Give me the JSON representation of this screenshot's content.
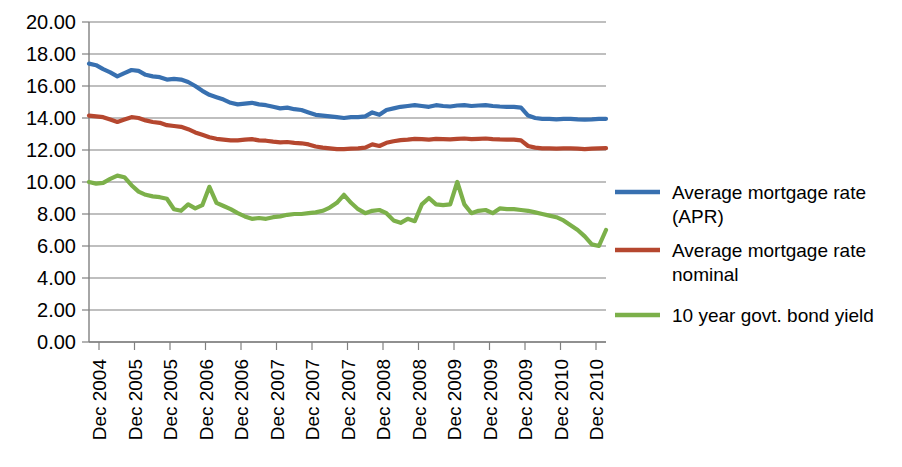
{
  "chart_data": {
    "type": "line",
    "title": "",
    "subtitle": "",
    "xlabel": "",
    "ylabel": "",
    "ylim": [
      0.0,
      20.0
    ],
    "y_ticks": [
      "0.00",
      "2.00",
      "4.00",
      "6.00",
      "8.00",
      "10.00",
      "12.00",
      "14.00",
      "16.00",
      "18.00",
      "20.00"
    ],
    "y_tick_values": [
      0,
      2,
      4,
      6,
      8,
      10,
      12,
      14,
      16,
      18,
      20
    ],
    "grid": true,
    "legend_position": "right",
    "x_tick_labels": [
      "Dec 2004",
      "Dec 2005",
      "Dec 2005",
      "Dec 2006",
      "Dec 2006",
      "Dec 2007",
      "Dec 2007",
      "Dec 2007",
      "Dec 2008",
      "Dec 2008",
      "Dec 2009",
      "Dec 2009",
      "Dec 2009",
      "Dec 2010",
      "Dec 2010"
    ],
    "x_index_count": 74,
    "series": [
      {
        "name": "Average mortgage rate (APR)",
        "color": "#3870b0",
        "values": [
          17.4,
          17.3,
          17.05,
          16.85,
          16.6,
          16.8,
          17.0,
          16.95,
          16.7,
          16.6,
          16.55,
          16.4,
          16.45,
          16.4,
          16.25,
          16.0,
          15.7,
          15.45,
          15.3,
          15.15,
          14.95,
          14.85,
          14.9,
          14.95,
          14.85,
          14.8,
          14.7,
          14.6,
          14.65,
          14.55,
          14.5,
          14.35,
          14.2,
          14.15,
          14.1,
          14.05,
          14.0,
          14.05,
          14.05,
          14.1,
          14.35,
          14.2,
          14.5,
          14.6,
          14.7,
          14.75,
          14.8,
          14.75,
          14.7,
          14.8,
          14.75,
          14.72,
          14.78,
          14.8,
          14.75,
          14.78,
          14.8,
          14.75,
          14.72,
          14.7,
          14.7,
          14.65,
          14.15,
          14.0,
          13.95,
          13.95,
          13.92,
          13.95,
          13.95,
          13.92,
          13.9,
          13.92,
          13.95,
          13.95
        ]
      },
      {
        "name": "Average mortgage rate nominal",
        "color": "#b5472f",
        "values": [
          14.15,
          14.1,
          14.05,
          13.9,
          13.75,
          13.9,
          14.05,
          14.0,
          13.85,
          13.75,
          13.7,
          13.55,
          13.5,
          13.45,
          13.3,
          13.1,
          12.95,
          12.8,
          12.7,
          12.65,
          12.6,
          12.6,
          12.65,
          12.68,
          12.6,
          12.58,
          12.52,
          12.48,
          12.5,
          12.45,
          12.42,
          12.35,
          12.22,
          12.15,
          12.1,
          12.05,
          12.05,
          12.08,
          12.1,
          12.15,
          12.35,
          12.25,
          12.45,
          12.55,
          12.62,
          12.65,
          12.7,
          12.68,
          12.65,
          12.7,
          12.68,
          12.66,
          12.7,
          12.72,
          12.68,
          12.7,
          12.72,
          12.68,
          12.66,
          12.65,
          12.65,
          12.6,
          12.25,
          12.15,
          12.1,
          12.1,
          12.08,
          12.1,
          12.1,
          12.08,
          12.05,
          12.08,
          12.1,
          12.12
        ]
      },
      {
        "name": "10 year govt. bond yield",
        "color": "#7cb04a",
        "values": [
          10.0,
          9.9,
          9.95,
          10.2,
          10.4,
          10.3,
          9.8,
          9.4,
          9.2,
          9.1,
          9.05,
          8.95,
          8.3,
          8.2,
          8.6,
          8.35,
          8.55,
          9.7,
          8.7,
          8.5,
          8.3,
          8.05,
          7.85,
          7.7,
          7.75,
          7.7,
          7.8,
          7.85,
          7.95,
          8.0,
          8.0,
          8.05,
          8.1,
          8.2,
          8.4,
          8.7,
          9.2,
          8.7,
          8.3,
          8.05,
          8.2,
          8.25,
          8.05,
          7.6,
          7.45,
          7.7,
          7.55,
          8.6,
          9.0,
          8.6,
          8.55,
          8.6,
          10.0,
          8.6,
          8.05,
          8.2,
          8.25,
          8.05,
          8.35,
          8.3,
          8.3,
          8.25,
          8.2,
          8.1,
          8.0,
          7.9,
          7.8,
          7.6,
          7.3,
          7.0,
          6.6,
          6.1,
          6.0,
          7.0
        ]
      }
    ]
  },
  "legend": {
    "items": [
      {
        "label_line1": "Average mortgage rate",
        "label_line2": "(APR)",
        "color": "#3870b0"
      },
      {
        "label_line1": "Average mortgage rate",
        "label_line2": "nominal",
        "color": "#b5472f"
      },
      {
        "label_line1": "10 year govt. bond yield",
        "label_line2": "",
        "color": "#7cb04a"
      }
    ]
  },
  "colors": {
    "blue": "#3870b0",
    "red": "#b5472f",
    "green": "#7cb04a",
    "grid": "#808080",
    "text": "#000000",
    "background": "#ffffff"
  }
}
